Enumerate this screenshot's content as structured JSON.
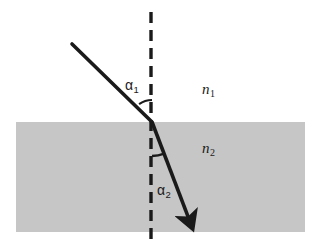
{
  "figure": {
    "kind": "optics-refraction-diagram",
    "canvas": {
      "width": 321,
      "height": 243,
      "background": "#ffffff"
    }
  },
  "media": {
    "upper": {
      "label": "n",
      "subscript": "1",
      "fill": "#ffffff",
      "region": {
        "x": 16,
        "y": 0,
        "width": 289,
        "height": 122
      }
    },
    "lower": {
      "label": "n",
      "subscript": "2",
      "fill": "#c6c6c6",
      "region": {
        "x": 16,
        "y": 122,
        "width": 289,
        "height": 110
      }
    }
  },
  "angles": {
    "incident": {
      "label": "α",
      "subscript": "1",
      "arc_radius": 22,
      "value_deg": 36
    },
    "refracted": {
      "label": "α",
      "subscript": "2",
      "arc_radius": 34,
      "value_deg": 21
    }
  },
  "normal_line": {
    "name": "normal",
    "style": "dashed",
    "color": "#1a1a1a",
    "x": 151,
    "y_top": 12,
    "y_bottom": 240,
    "stroke_width": 3.4,
    "dash": "11 7"
  },
  "rays": {
    "incident": {
      "name": "incident-ray",
      "color": "#1a1a1a",
      "stroke_width": 3.6,
      "start": {
        "x": 72,
        "y": 44
      },
      "end": {
        "x": 152,
        "y": 122
      }
    },
    "refracted": {
      "name": "refracted-ray",
      "color": "#1a1a1a",
      "stroke_width": 3.6,
      "start": {
        "x": 152,
        "y": 122
      },
      "end": {
        "x": 192,
        "y": 227
      },
      "arrowhead": true
    }
  },
  "interface": {
    "name": "interface-boundary",
    "y": 122,
    "point": {
      "x": 152,
      "y": 122
    }
  }
}
